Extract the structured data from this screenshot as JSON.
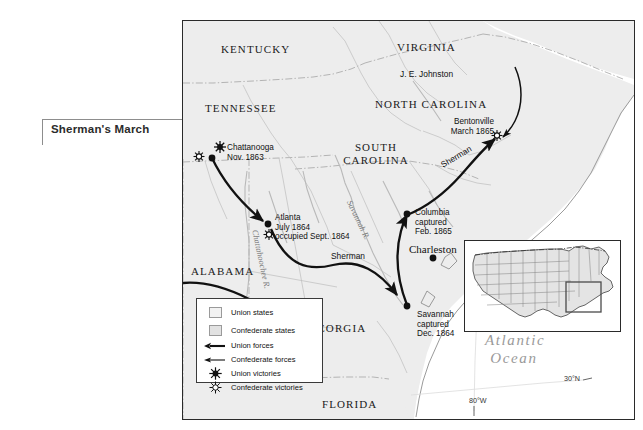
{
  "caption": {
    "title": "Sherman's March"
  },
  "map": {
    "states": [
      {
        "name": "KENTUCKY",
        "x": 38,
        "y": 22
      },
      {
        "name": "VIRGINIA",
        "x": 214,
        "y": 20
      },
      {
        "name": "TENNESSEE",
        "x": 22,
        "y": 81
      },
      {
        "name": "NORTH CAROLINA",
        "x": 192,
        "y": 77
      },
      {
        "name": "SOUTH CAROLINA",
        "x": 155,
        "y": 126
      },
      {
        "name": "ALABAMA",
        "x": 8,
        "y": 244
      },
      {
        "name": "GEORGIA",
        "x": 126,
        "y": 301
      },
      {
        "name": "FLORIDA",
        "x": 139,
        "y": 377
      }
    ],
    "cities": [
      {
        "name": "Chattanooga",
        "lines": [
          "Chattanooga",
          "Nov. 1863"
        ],
        "x": 38,
        "y": 128,
        "dot_x": 29,
        "dot_y": 137
      },
      {
        "name": "Atlanta",
        "lines": [
          "Atlanta",
          "July 1864",
          "occupied Sept. 1864"
        ],
        "x": 92,
        "y": 192,
        "dot_x": 85,
        "dot_y": 203
      },
      {
        "name": "Bentonville",
        "lines": [
          "Bentonville",
          "March 1865"
        ],
        "x": 225,
        "y": 96,
        "dot_x": 0,
        "dot_y": 0
      },
      {
        "name": "Columbia",
        "lines": [
          "Columbia",
          "captured",
          "Feb. 1865"
        ],
        "x": 232,
        "y": 190,
        "dot_x": 224,
        "dot_y": 193
      },
      {
        "name": "Savannah",
        "lines": [
          "Savannah",
          "captured",
          "Dec. 1864"
        ],
        "x": 234,
        "y": 288,
        "dot_x": 224,
        "dot_y": 285
      }
    ],
    "charleston": {
      "label": "Charleston",
      "x": 231,
      "y": 218,
      "dot_x": 250,
      "dot_y": 237
    },
    "route_labels": [
      {
        "text": "J. E. Johnston",
        "x": 215,
        "y": 48
      },
      {
        "text": "Sherman",
        "x": 262,
        "y": 140,
        "rotate": -28
      },
      {
        "text": "Sherman",
        "x": 148,
        "y": 232
      }
    ],
    "rivers": [
      {
        "text": "Savannah R.",
        "x": 174,
        "y": 192,
        "rotate": 62
      },
      {
        "text": "Chattahoochee R.",
        "x": 78,
        "y": 215,
        "rotate": 75
      }
    ],
    "ocean": {
      "lines": [
        "Atlantic",
        "Ocean"
      ],
      "x": 302,
      "y": 318
    },
    "coords": [
      {
        "text": "30°N",
        "x": 385,
        "y": 369
      },
      {
        "text": "80°W",
        "x": 291,
        "y": 389
      }
    ]
  },
  "legend": {
    "rows": [
      {
        "key": "swatch-union",
        "label": "Union states"
      },
      {
        "key": "swatch-confederate",
        "label": "Confederate states"
      },
      {
        "key": "arrow-union",
        "label": "Union forces"
      },
      {
        "key": "arrow-confederate",
        "label": "Confederate forces"
      },
      {
        "key": "sunburst-union",
        "label": "Union victories"
      },
      {
        "key": "sunburst-confederate",
        "label": "Confederate victories"
      }
    ]
  },
  "colors": {
    "land": "#eeeeee",
    "land_dark": "#e3e3e3",
    "ocean": "#ffffff",
    "border": "#2a2a2a",
    "route": "#111111",
    "river": "#b9b9b9",
    "state_line": "#a8a8a8"
  }
}
